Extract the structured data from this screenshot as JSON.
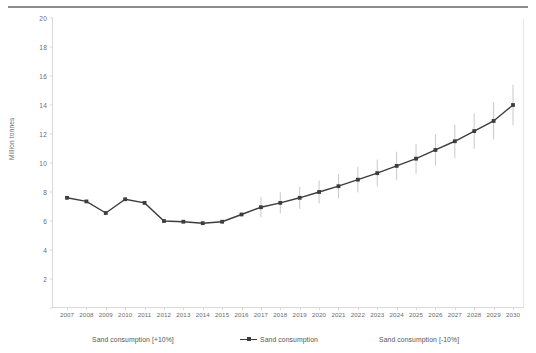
{
  "figure": {
    "top_rule": "horizontal-rule"
  },
  "chart_data": {
    "type": "line",
    "title": "",
    "subtitle": "",
    "xlabel": "",
    "ylabel": "Million tonnes",
    "ylim": [
      0,
      20
    ],
    "yticks": [
      0,
      2,
      4,
      6,
      8,
      10,
      12,
      14,
      16,
      18,
      20
    ],
    "ytick_labels": [
      "",
      "2",
      "4",
      "6",
      "8",
      "10",
      "12",
      "14",
      "16",
      "18",
      "20"
    ],
    "grid": false,
    "legend_position": "bottom",
    "categories": [
      "2007",
      "2008",
      "2009",
      "2010",
      "2011",
      "2012",
      "2013",
      "2014",
      "2015",
      "2016",
      "2017",
      "2018",
      "2019",
      "2020",
      "2021",
      "2022",
      "2023",
      "2024",
      "2025",
      "2026",
      "2027",
      "2028",
      "2029",
      "2030"
    ],
    "x": [
      2007,
      2008,
      2009,
      2010,
      2011,
      2012,
      2013,
      2014,
      2015,
      2016,
      2017,
      2018,
      2019,
      2020,
      2021,
      2022,
      2023,
      2024,
      2025,
      2026,
      2027,
      2028,
      2029,
      2030
    ],
    "series": [
      {
        "name": "Sand consumption",
        "color": "#3d3d3d",
        "marker": "square",
        "values": [
          7.6,
          7.35,
          6.55,
          7.5,
          7.25,
          6.0,
          5.95,
          5.85,
          5.95,
          6.45,
          6.95,
          7.25,
          7.6,
          8.0,
          8.4,
          8.85,
          9.3,
          9.8,
          10.3,
          10.9,
          11.5,
          12.2,
          12.9,
          14.0
        ]
      },
      {
        "name": "Sand consumption [+10%]",
        "color": "#c9c9c9",
        "role": "error-bar-upper",
        "values": [
          null,
          null,
          null,
          null,
          null,
          null,
          null,
          null,
          null,
          null,
          7.65,
          7.98,
          8.36,
          8.8,
          9.24,
          9.74,
          10.23,
          10.78,
          11.33,
          11.99,
          12.65,
          13.42,
          14.19,
          15.4
        ]
      },
      {
        "name": "Sand consumption [-10%]",
        "color": "#c9c9c9",
        "role": "error-bar-lower",
        "values": [
          null,
          null,
          null,
          null,
          null,
          null,
          null,
          null,
          null,
          null,
          6.26,
          6.53,
          6.84,
          7.2,
          7.56,
          7.97,
          8.37,
          8.82,
          9.27,
          9.81,
          10.35,
          10.98,
          11.61,
          12.6
        ]
      }
    ],
    "legend": [
      {
        "label": "Sand consumption [+10%]",
        "marker": "none",
        "color": "#c9c9c9"
      },
      {
        "label": "Sand consumption",
        "marker": "line-marker",
        "color": "#3d3d3d"
      },
      {
        "label": "Sand consumption [-10%]",
        "marker": "none",
        "color": "#c9c9c9"
      }
    ]
  }
}
